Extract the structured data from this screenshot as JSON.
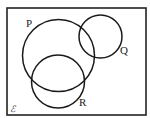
{
  "diagram": {
    "type": "venn",
    "universal_set_label": "ℰ",
    "frame": {
      "x": 7,
      "y": 8,
      "width": 139,
      "height": 107,
      "stroke": "#222222"
    },
    "sets": [
      {
        "name": "P",
        "label": "P",
        "cx": 58.5,
        "cy": 55.5,
        "r": 36,
        "label_x": 26,
        "label_y": 27
      },
      {
        "name": "Q",
        "label": "Q",
        "cx": 100.5,
        "cy": 36.5,
        "r": 21.5,
        "label_x": 120,
        "label_y": 54
      },
      {
        "name": "R",
        "label": "R",
        "cx": 58,
        "cy": 81.5,
        "r": 26.5,
        "label_x": 79,
        "label_y": 106
      }
    ],
    "relationships": [
      "P intersects Q",
      "P intersects R",
      "Q and R are disjoint"
    ]
  }
}
